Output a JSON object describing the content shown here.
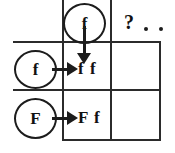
{
  "diagram": {
    "type": "punnett-square",
    "title_visible": false,
    "background_color": "#ffffff",
    "ink_color": "#1c1c1c"
  },
  "top_parent": {
    "allele": "f",
    "arrow_direction": "down"
  },
  "left_parents": [
    {
      "allele": "f",
      "arrow_direction": "right"
    },
    {
      "allele": "F",
      "arrow_direction": "right"
    }
  ],
  "cells": [
    {
      "genotype": "f f",
      "row": 0,
      "col": 0,
      "filled": true
    },
    {
      "genotype": "",
      "row": 0,
      "col": 1,
      "filled": false
    },
    {
      "genotype": "F f",
      "row": 1,
      "col": 0,
      "filled": true
    },
    {
      "genotype": "",
      "row": 1,
      "col": 1,
      "filled": false
    }
  ],
  "annotation": {
    "question_mark": "?",
    "ellipsis_dots": 2
  }
}
